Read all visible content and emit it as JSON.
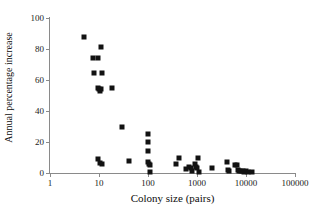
{
  "chart_data": {
    "type": "scatter",
    "title": "",
    "xlabel": "Colony size (pairs)",
    "ylabel": "Annual percentage increase",
    "xscale": "log",
    "yscale": "linear",
    "xlim": [
      1,
      100000
    ],
    "ylim": [
      0,
      100
    ],
    "grid": false,
    "legend": null,
    "xticks": [
      1,
      10,
      100,
      1000,
      10000,
      100000
    ],
    "xtick_labels": [
      "1",
      "10",
      "100",
      "1000",
      "10000",
      "100000"
    ],
    "yticks": [
      0,
      20,
      40,
      60,
      80,
      100
    ],
    "ytick_labels": [
      "0",
      "20",
      "40",
      "60",
      "80",
      "100"
    ],
    "marker": "filled-square",
    "marker_color": "#121212",
    "axis_color": "#8a8a8a",
    "points": [
      {
        "x": 5,
        "y": 88
      },
      {
        "x": 7.5,
        "y": 74
      },
      {
        "x": 9.5,
        "y": 74
      },
      {
        "x": 8,
        "y": 64.5
      },
      {
        "x": 11,
        "y": 81
      },
      {
        "x": 11.5,
        "y": 64.5
      },
      {
        "x": 9.5,
        "y": 55
      },
      {
        "x": 10,
        "y": 54
      },
      {
        "x": 10.5,
        "y": 53
      },
      {
        "x": 11,
        "y": 54.5
      },
      {
        "x": 18,
        "y": 55
      },
      {
        "x": 30,
        "y": 30
      },
      {
        "x": 9.5,
        "y": 9
      },
      {
        "x": 10.5,
        "y": 6.5
      },
      {
        "x": 11.5,
        "y": 6
      },
      {
        "x": 40,
        "y": 8
      },
      {
        "x": 100,
        "y": 25
      },
      {
        "x": 100,
        "y": 20
      },
      {
        "x": 100,
        "y": 14
      },
      {
        "x": 100,
        "y": 7
      },
      {
        "x": 105,
        "y": 6
      },
      {
        "x": 110,
        "y": 5
      },
      {
        "x": 110,
        "y": 0.5
      },
      {
        "x": 380,
        "y": 6
      },
      {
        "x": 430,
        "y": 9.5
      },
      {
        "x": 600,
        "y": 2.5
      },
      {
        "x": 700,
        "y": 4
      },
      {
        "x": 750,
        "y": 3
      },
      {
        "x": 800,
        "y": 1
      },
      {
        "x": 900,
        "y": 6
      },
      {
        "x": 950,
        "y": 4
      },
      {
        "x": 1000,
        "y": 3.5
      },
      {
        "x": 1050,
        "y": 9.5
      },
      {
        "x": 1100,
        "y": 0.5
      },
      {
        "x": 2000,
        "y": 3
      },
      {
        "x": 4000,
        "y": 7
      },
      {
        "x": 4200,
        "y": 2
      },
      {
        "x": 4400,
        "y": 1
      },
      {
        "x": 6000,
        "y": 5
      },
      {
        "x": 6500,
        "y": 5
      },
      {
        "x": 7000,
        "y": 2
      },
      {
        "x": 7200,
        "y": 1
      },
      {
        "x": 8000,
        "y": 1.5
      },
      {
        "x": 8500,
        "y": 1
      },
      {
        "x": 9000,
        "y": 0.5
      },
      {
        "x": 10000,
        "y": 1
      },
      {
        "x": 11000,
        "y": 0.5
      },
      {
        "x": 13000,
        "y": 0.5
      }
    ]
  }
}
